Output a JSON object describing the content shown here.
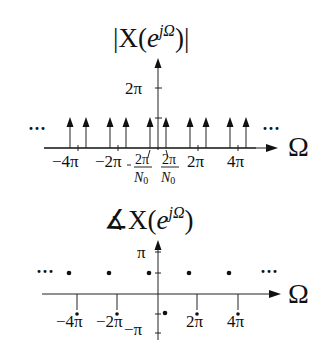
{
  "top_plot": {
    "title_prefix": "|X(",
    "title_base": "e",
    "title_sup": "jΩ",
    "title_suffix": ")|",
    "y_tick_label": "2π",
    "x_axis_label": "Ω",
    "ellipsis_left": "···",
    "ellipsis_right": "···",
    "x_tick_labels": [
      "−4π",
      "−2π",
      "2π",
      "4π"
    ],
    "frac_num": "2π",
    "frac_den_base": "N",
    "frac_den_sub": "0",
    "neg_sign": "−"
  },
  "bottom_plot": {
    "title_angle": "∡",
    "title_prefix": "X(",
    "title_base": "e",
    "title_sup": "jΩ",
    "title_suffix": ")",
    "y_tick_pos": "π",
    "y_tick_neg": "−π",
    "x_axis_label": "Ω",
    "ellipsis_left": "···",
    "ellipsis_right": "···",
    "x_tick_labels": [
      "−4π",
      "−2π",
      "2π",
      "4π"
    ]
  }
}
